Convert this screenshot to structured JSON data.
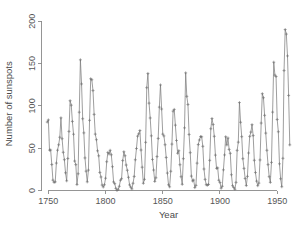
{
  "chart_data": {
    "type": "line",
    "title": "",
    "subtitle": "",
    "xlabel": "Year",
    "ylabel": "Number of sunspots",
    "xlim": [
      1744,
      1966
    ],
    "ylim": [
      0,
      205
    ],
    "xticks": [
      1750,
      1800,
      1850,
      1900,
      1950
    ],
    "xtick_labels": [
      "1750",
      "1800",
      "1850",
      "1900",
      "1950"
    ],
    "yticks": [
      0,
      50,
      100,
      150,
      200
    ],
    "ytick_labels": [
      "0",
      "50",
      "100",
      "150",
      "200"
    ],
    "grid": false,
    "legend": false,
    "legend_position": "none",
    "marker": "plus",
    "line_color": "#7e7e7e",
    "axis_color": "#8a8a8a",
    "background_color": "#ffffff",
    "series": [
      {
        "name": "Annual mean sunspot number",
        "x": [
          1749,
          1750,
          1751,
          1752,
          1753,
          1754,
          1755,
          1756,
          1757,
          1758,
          1759,
          1760,
          1761,
          1762,
          1763,
          1764,
          1765,
          1766,
          1767,
          1768,
          1769,
          1770,
          1771,
          1772,
          1773,
          1774,
          1775,
          1776,
          1777,
          1778,
          1779,
          1780,
          1781,
          1782,
          1783,
          1784,
          1785,
          1786,
          1787,
          1788,
          1789,
          1790,
          1791,
          1792,
          1793,
          1794,
          1795,
          1796,
          1797,
          1798,
          1799,
          1800,
          1801,
          1802,
          1803,
          1804,
          1805,
          1806,
          1807,
          1808,
          1809,
          1810,
          1811,
          1812,
          1813,
          1814,
          1815,
          1816,
          1817,
          1818,
          1819,
          1820,
          1821,
          1822,
          1823,
          1824,
          1825,
          1826,
          1827,
          1828,
          1829,
          1830,
          1831,
          1832,
          1833,
          1834,
          1835,
          1836,
          1837,
          1838,
          1839,
          1840,
          1841,
          1842,
          1843,
          1844,
          1845,
          1846,
          1847,
          1848,
          1849,
          1850,
          1851,
          1852,
          1853,
          1854,
          1855,
          1856,
          1857,
          1858,
          1859,
          1860,
          1861,
          1862,
          1863,
          1864,
          1865,
          1866,
          1867,
          1868,
          1869,
          1870,
          1871,
          1872,
          1873,
          1874,
          1875,
          1876,
          1877,
          1878,
          1879,
          1880,
          1881,
          1882,
          1883,
          1884,
          1885,
          1886,
          1887,
          1888,
          1889,
          1890,
          1891,
          1892,
          1893,
          1894,
          1895,
          1896,
          1897,
          1898,
          1899,
          1900,
          1901,
          1902,
          1903,
          1904,
          1905,
          1906,
          1907,
          1908,
          1909,
          1910,
          1911,
          1912,
          1913,
          1914,
          1915,
          1916,
          1917,
          1918,
          1919,
          1920,
          1921,
          1922,
          1923,
          1924,
          1925,
          1926,
          1927,
          1928,
          1929,
          1930,
          1931,
          1932,
          1933,
          1934,
          1935,
          1936,
          1937,
          1938,
          1939,
          1940,
          1941,
          1942,
          1943,
          1944,
          1945,
          1946,
          1947,
          1948,
          1949,
          1950,
          1951,
          1952,
          1953,
          1954,
          1955,
          1956,
          1957,
          1958,
          1959,
          1960,
          1961
        ],
        "values": [
          80.9,
          83.4,
          47.7,
          47.8,
          30.7,
          12.2,
          9.6,
          10.2,
          32.4,
          47.6,
          54.0,
          62.9,
          85.9,
          61.2,
          45.1,
          36.4,
          20.9,
          11.4,
          37.8,
          69.8,
          106.1,
          100.8,
          81.6,
          66.5,
          34.8,
          30.6,
          7.0,
          19.8,
          92.5,
          154.4,
          125.9,
          84.8,
          68.1,
          38.5,
          22.8,
          10.2,
          24.1,
          82.9,
          132.0,
          130.9,
          118.1,
          89.9,
          66.6,
          60.0,
          46.9,
          41.0,
          21.3,
          16.0,
          6.4,
          4.1,
          6.8,
          14.5,
          34.0,
          45.0,
          43.1,
          47.5,
          42.2,
          28.1,
          10.1,
          8.1,
          2.5,
          0.0,
          1.4,
          5.0,
          12.2,
          13.9,
          35.4,
          45.8,
          41.1,
          30.1,
          23.9,
          15.6,
          6.6,
          4.0,
          1.8,
          8.5,
          16.6,
          36.3,
          49.6,
          64.2,
          67.0,
          70.9,
          47.8,
          27.5,
          8.5,
          13.2,
          56.9,
          121.5,
          138.3,
          103.2,
          85.7,
          64.6,
          36.7,
          24.2,
          10.7,
          15.0,
          40.1,
          61.5,
          98.5,
          124.7,
          96.3,
          66.6,
          64.5,
          54.1,
          39.0,
          20.6,
          6.7,
          4.3,
          22.7,
          54.8,
          93.8,
          95.8,
          77.2,
          59.1,
          44.0,
          47.0,
          30.5,
          16.3,
          7.3,
          37.6,
          74.0,
          139.0,
          111.2,
          101.6,
          66.2,
          44.7,
          17.0,
          11.3,
          12.4,
          3.4,
          6.0,
          32.3,
          54.3,
          59.7,
          63.7,
          63.5,
          52.2,
          25.4,
          13.1,
          6.8,
          6.3,
          7.1,
          35.6,
          73.0,
          85.1,
          78.0,
          64.0,
          41.8,
          26.2,
          26.7,
          12.1,
          9.5,
          2.7,
          5.0,
          24.4,
          42.0,
          63.5,
          53.8,
          62.0,
          48.5,
          43.9,
          18.6,
          5.7,
          3.6,
          1.4,
          9.6,
          47.4,
          57.1,
          103.9,
          80.6,
          63.6,
          37.6,
          26.1,
          14.2,
          5.8,
          16.7,
          44.3,
          63.9,
          69.0,
          77.8,
          64.9,
          35.7,
          21.2,
          11.1,
          5.7,
          8.7,
          36.1,
          79.7,
          114.4,
          109.6,
          88.8,
          67.8,
          47.5,
          30.6,
          16.3,
          9.6,
          33.2,
          92.6,
          151.6,
          136.3,
          134.7,
          83.9,
          69.4,
          31.5,
          13.9,
          4.4,
          38.0,
          141.7,
          190.2,
          184.8,
          159.0,
          112.3,
          53.9
        ]
      }
    ]
  },
  "axes": {
    "y_title": "Number of sunspots",
    "x_title": "Year"
  }
}
